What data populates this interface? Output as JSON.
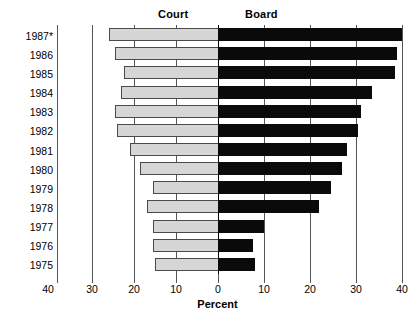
{
  "headers": {
    "left_panel": "Court",
    "right_panel": "Board"
  },
  "axis": {
    "x_title": "Percent",
    "tick_labels_left": [
      "40",
      "30",
      "20",
      "10"
    ],
    "tick_labels_right": [
      "0",
      "10",
      "20",
      "30",
      "40"
    ],
    "outer_left_label": "40"
  },
  "colors": {
    "court_fill": "#d6d6d6",
    "court_border": "#4a4a4a",
    "board_fill": "#0a0a0a",
    "grid": "#555555",
    "axis": "#000000",
    "background": "#ffffff"
  },
  "chart_data": {
    "type": "bar",
    "orientation": "horizontal",
    "layout": "diverging-butterfly",
    "title": "",
    "subtitle": "",
    "xlabel": "Percent",
    "ylabel": "",
    "xlim": [
      -40,
      40
    ],
    "x_ticks_left": [
      40,
      30,
      20,
      10
    ],
    "x_ticks_right": [
      0,
      10,
      20,
      30,
      40
    ],
    "grid": true,
    "legend": "panel-headers",
    "legend_position": "top",
    "categories": [
      "1987*",
      "1986",
      "1985",
      "1984",
      "1983",
      "1982",
      "1981",
      "1980",
      "1979",
      "1978",
      "1977",
      "1976",
      "1975"
    ],
    "series": [
      {
        "name": "Court",
        "side": "left",
        "values": [
          26,
          24.5,
          22.5,
          23,
          24.5,
          24,
          21,
          18.5,
          15.5,
          17,
          15.5,
          15.5,
          15
        ]
      },
      {
        "name": "Board",
        "side": "right",
        "values": [
          40,
          39,
          38.5,
          33.5,
          31,
          30.5,
          28,
          27,
          24.5,
          22,
          10,
          7.5,
          8
        ]
      }
    ],
    "annotations": [
      "* asterisk on 1987 category label"
    ]
  }
}
